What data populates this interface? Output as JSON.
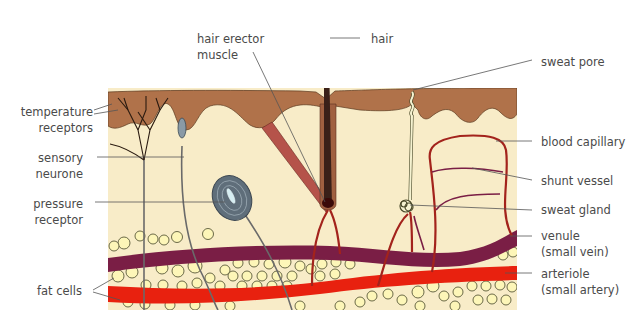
{
  "diagram": {
    "type": "cross-section",
    "colors": {
      "epidermis": "#b0724a",
      "dermis": "#f8ecc8",
      "hair": "#3a2018",
      "muscle": "#b5534a",
      "venule": "#7a1e45",
      "arteriole": "#e8210f",
      "capillary": "#a3231c",
      "fat_cell_fill": "#fdf6b8",
      "fat_cell_stroke": "#5a5a3a",
      "nerve": "#6a6a6a",
      "pressure_receptor": "#5f6e7a",
      "sweat_duct": "#f5f2d0",
      "label_text": "#4a4a4a",
      "leader_line": "#555555"
    }
  },
  "labels": {
    "left": [
      {
        "id": "temperature-receptors",
        "line1": "temperature",
        "line2": "receptors"
      },
      {
        "id": "sensory-neurone",
        "line1": "sensory",
        "line2": "neurone"
      },
      {
        "id": "pressure-receptor",
        "line1": "pressure",
        "line2": "receptor"
      },
      {
        "id": "fat-cells",
        "line1": "fat cells",
        "line2": ""
      }
    ],
    "top": [
      {
        "id": "hair-erector-muscle",
        "line1": "hair erector",
        "line2": "muscle"
      },
      {
        "id": "hair",
        "line1": "hair",
        "line2": ""
      }
    ],
    "right": [
      {
        "id": "sweat-pore",
        "line1": "sweat pore",
        "line2": ""
      },
      {
        "id": "blood-capillary",
        "line1": "blood capillary",
        "line2": ""
      },
      {
        "id": "shunt-vessel",
        "line1": "shunt vessel",
        "line2": ""
      },
      {
        "id": "sweat-gland",
        "line1": "sweat gland",
        "line2": ""
      },
      {
        "id": "venule",
        "line1": "venule",
        "line2": "(small vein)"
      },
      {
        "id": "arteriole",
        "line1": "arteriole",
        "line2": "(small artery)"
      }
    ]
  }
}
